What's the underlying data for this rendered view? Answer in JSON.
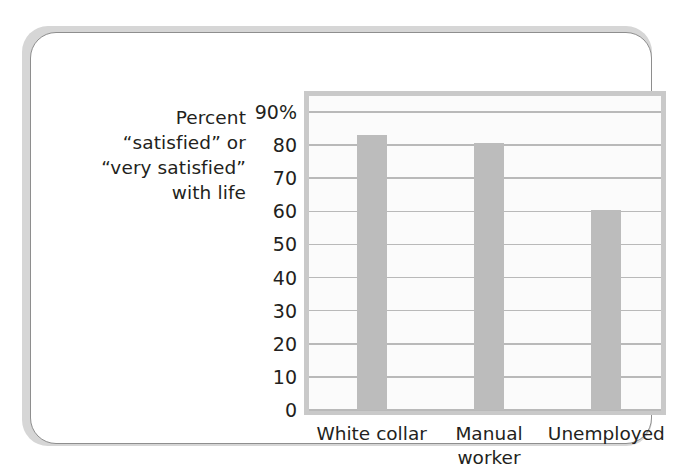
{
  "figure": {
    "name": "life-satisfaction-bar-chart",
    "card_background": "#ffffff",
    "card_border_color": "#8e8e8e"
  },
  "axis_caption": {
    "line1": "Percent",
    "line2": "“satisfied” or",
    "line3": "“very satisfied”",
    "line4": "with life"
  },
  "chart_data": {
    "type": "bar",
    "title": "",
    "xlabel": "",
    "ylabel": "Percent “satisfied” or “very satisfied” with life",
    "categories": [
      "White collar",
      "Manual worker",
      "Unemployed"
    ],
    "category_lines": [
      [
        "White collar"
      ],
      [
        "Manual",
        "worker"
      ],
      [
        "Unemployed"
      ]
    ],
    "values": [
      83,
      80.5,
      60.5
    ],
    "ylim": [
      0,
      90
    ],
    "yticks": [
      0,
      10,
      20,
      30,
      40,
      50,
      60,
      70,
      80,
      90
    ],
    "ytick_labels": [
      "0",
      "10",
      "20",
      "30",
      "40",
      "50",
      "60",
      "70",
      "80",
      "90%"
    ],
    "grid": true,
    "legend": "none",
    "bar_color": "#bcbcbc",
    "gridline_color": "#b9b9b9",
    "plot_background": "#fbfbfb",
    "plot_border_color": "#c9c9c9"
  }
}
